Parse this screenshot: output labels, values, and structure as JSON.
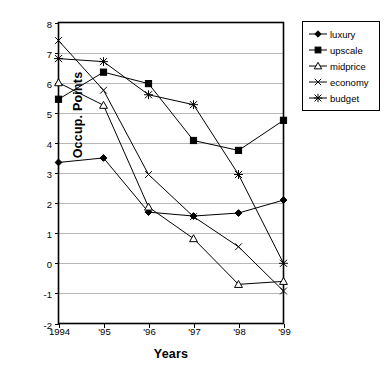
{
  "chart_data": {
    "type": "line",
    "title": "",
    "xlabel": "Years",
    "ylabel": "Occup. Points",
    "categories": [
      "1994",
      "'95",
      "'96",
      "'97",
      "'98",
      "'99"
    ],
    "ylim": [
      -2,
      8
    ],
    "ytick_labels": [
      "8",
      "7",
      "6",
      "5",
      "4",
      "3",
      "2",
      "1",
      "0",
      "-1",
      "-2"
    ],
    "yticks": [
      8,
      7,
      6,
      5,
      4,
      3,
      2,
      1,
      0,
      -1,
      -2
    ],
    "grid": "horizontal",
    "legend_position": "right",
    "series": [
      {
        "name": "luxury",
        "marker": "filled-diamond",
        "values": [
          3.35,
          3.5,
          1.7,
          1.57,
          1.67,
          2.1
        ]
      },
      {
        "name": "upscale",
        "marker": "filled-square",
        "values": [
          5.45,
          6.35,
          5.97,
          4.08,
          3.75,
          4.75
        ]
      },
      {
        "name": "midprice",
        "marker": "open-triangle",
        "values": [
          6.0,
          5.25,
          1.87,
          0.82,
          -0.7,
          -0.6
        ]
      },
      {
        "name": "economy",
        "marker": "cross-x",
        "values": [
          7.4,
          5.75,
          2.95,
          1.55,
          0.55,
          -0.92
        ]
      },
      {
        "name": "budget",
        "marker": "asterisk",
        "values": [
          6.8,
          6.7,
          5.6,
          5.27,
          2.95,
          0.0
        ]
      }
    ]
  },
  "legend": {
    "items": [
      {
        "label": "luxury"
      },
      {
        "label": "upscale"
      },
      {
        "label": "midprice"
      },
      {
        "label": "economy"
      },
      {
        "label": "budget"
      }
    ]
  }
}
